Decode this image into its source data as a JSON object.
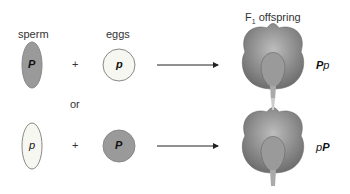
{
  "headers": {
    "sperm": "sperm",
    "eggs": "eggs",
    "offspring_prefix": "F",
    "offspring_sub": "1",
    "offspring_suffix": " offspring"
  },
  "connector": "or",
  "rows": [
    {
      "sperm_allele": "P",
      "egg_allele": "p",
      "plus": "+",
      "genotype_first": "P",
      "genotype_second": "p"
    },
    {
      "sperm_allele": "p",
      "egg_allele": "P",
      "plus": "+",
      "genotype_first": "p",
      "genotype_second": "P"
    }
  ],
  "colors": {
    "dominant_fill": "#9a9a9a",
    "recessive_fill": "#f7f7f2",
    "outline": "#888888",
    "flower": "#8a8a8a"
  }
}
